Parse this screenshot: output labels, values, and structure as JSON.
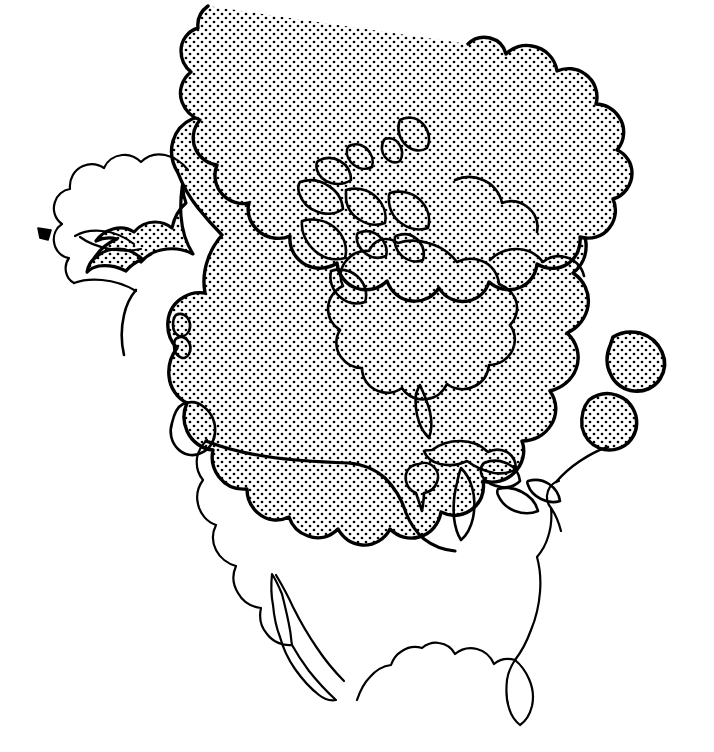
{
  "figure": {
    "kind": "map",
    "title": "North America",
    "background_color": "#ffffff",
    "ink_color": "#000000",
    "stipple_color": "#000000",
    "stipple_spacing_px": 8,
    "stipple_dot_radius_px": 1.35,
    "width_px": 714,
    "height_px": 752
  },
  "legend": {
    "shaded_meaning": "stippled area",
    "unshaded_meaning": "unshaded area"
  },
  "layers": [
    {
      "id": "continent-outline",
      "name": "continent-outline",
      "filled": false,
      "stroke_width": 2.2
    },
    {
      "id": "shaded-region",
      "name": "shaded-region",
      "filled": true,
      "fill": "stipple",
      "stroke_width": 3.4
    },
    {
      "id": "interior-coastlines",
      "name": "interior-coastlines",
      "filled": false,
      "stroke_width": 2.6
    },
    {
      "id": "islands",
      "name": "islands",
      "filled": true,
      "fill": "stipple",
      "stroke_width": 2.8
    }
  ],
  "regions": [
    {
      "name": "greenland",
      "shaded": true
    },
    {
      "name": "canadian-arctic-archipelago",
      "shaded": true
    },
    {
      "name": "hudson-bay",
      "shaded": true
    },
    {
      "name": "mainland-canada",
      "shaded": true
    },
    {
      "name": "alaska-eastern",
      "shaded": true
    },
    {
      "name": "alaska-western",
      "shaded": false
    },
    {
      "name": "aleutian-islands",
      "shaded": false
    },
    {
      "name": "vancouver-island",
      "shaded": true
    },
    {
      "name": "haida-gwaii",
      "shaded": true
    },
    {
      "name": "newfoundland",
      "shaded": true
    },
    {
      "name": "nova-scotia",
      "shaded": true
    },
    {
      "name": "great-lakes",
      "shaded": true
    },
    {
      "name": "northern-united-states",
      "shaded": true
    },
    {
      "name": "southern-united-states",
      "shaded": false
    },
    {
      "name": "florida-peninsula",
      "shaded": false
    },
    {
      "name": "baja-california",
      "shaded": false
    },
    {
      "name": "mexico",
      "shaded": false
    }
  ],
  "geo_paths": {
    "shaded_region": "M 322 44 C 318 49 314 56 313 62 C 312 68 314 74 318 77 C 314 79 309 78 305 75 C 300 71 296 66 293 61 C 291 65 289 70 288 75 C 287 82 289 89 292 95 C 287 96 281 95 277 92 C 272 112 268 133 266 154 C 265 166 265 178 267 189 C 256 193 246 199 238 208 C 230 217 225 229 224 241 C 223 252 226 263 232 272 C 223 275 215 280 209 287 C 200 297 195 310 194 324 C 193 338 196 352 203 364 C 192 368 183 376 177 386 C 169 399 166 415 168 430 C 170 443 176 455 185 464 C 180 472 177 481 176 490 C 175 504 179 518 188 529 C 199 542 215 549 232 549 C 246 549 259 544 270 535 C 276 546 286 554 298 557 C 312 561 327 558 339 549 C 347 559 358 565 370 566 C 383 567 395 561 403 551 C 411 560 422 565 434 565 C 447 565 459 559 467 549 C 474 558 484 563 495 563 C 508 563 520 556 527 545 C 534 553 544 557 554 556 C 567 555 578 547 583 535 C 591 541 601 543 610 540 C 621 536 629 527 631 516 C 640 518 649 516 656 510 C 665 503 669 491 667 480 C 676 478 683 472 687 464 C 692 454 691 442 685 433 C 692 427 696 418 696 409 C 696 398 690 388 681 383 C 686 375 687 365 684 356 C 680 345 671 338 660 336 C 663 327 662 317 657 309 C 651 299 641 294 630 295 C 631 286 628 277 622 270 C 615 262 604 259 594 261 C 593 251 588 243 580 238 C 571 232 560 232 551 237 C 548 228 541 221 532 218 C 522 214 511 217 503 224 C 498 216 489 211 479 211 C 468 211 458 217 453 226 C 446 219 437 216 428 218 C 417 220 409 229 407 240 C 399 235 389 234 380 238 C 370 243 364 253 364 264 C 355 261 345 262 337 268 C 328 275 324 285 325 296 C 316 295 307 298 300 305 C 293 312 290 322 292 332 C 283 333 274 338 269 346 C 263 355 263 366 268 375 C 259 377 251 383 247 392 C 242 401 243 412 248 421",
    "note": "Geometry below is drawn directly in SVG path data; this field is a descriptive placeholder only."
  }
}
